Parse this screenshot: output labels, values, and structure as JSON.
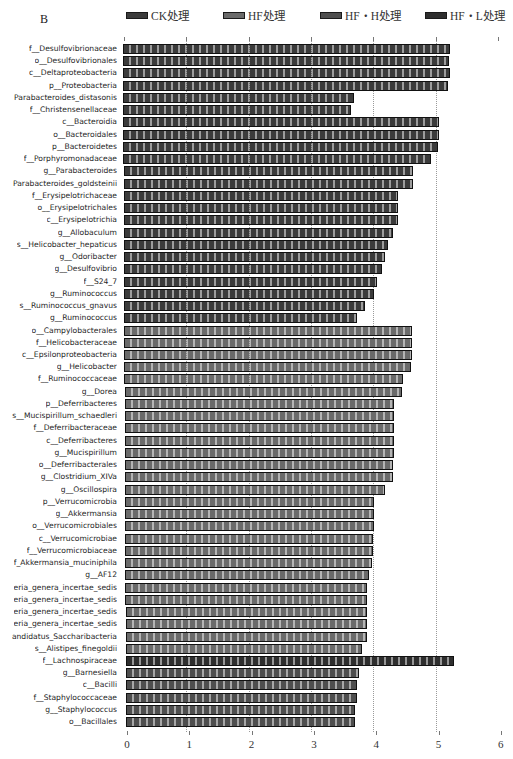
{
  "panel_label": "B",
  "legend": [
    {
      "label": "CK处理",
      "color": "#3b3b3b",
      "left": 126
    },
    {
      "label": "HF处理",
      "color": "#6a6a6a",
      "left": 223
    },
    {
      "label": "HF・H处理",
      "color": "#4e4e4e",
      "left": 320
    },
    {
      "label": "HF・L处理",
      "color": "#2e2e2e",
      "left": 425
    }
  ],
  "group_colors": {
    "CK": "#3b3b3b",
    "HF": "#6a6a6a",
    "HF_H": "#4e4e4e",
    "HF_L": "#2e2e2e"
  },
  "axis": {
    "ticks": [
      "0",
      "1",
      "2",
      "3",
      "4",
      "5",
      "6"
    ],
    "gridlines_at": [
      1,
      2,
      3,
      4,
      5
    ]
  },
  "chart_data": {
    "type": "bar",
    "orientation": "horizontal",
    "title": "",
    "xlabel": "",
    "ylabel": "",
    "xlim": [
      0,
      6
    ],
    "grid": "vertical dotted",
    "legend_position": "top",
    "legend": [
      "CK处理",
      "HF处理",
      "HF・H处理",
      "HF・L处理"
    ],
    "categories": [
      "f__Desulfovibrionaceae",
      "o__Desulfovibrionales",
      "c__Deltaproteobacteria",
      "p__Proteobacteria",
      "Parabacteroides_distasonis",
      "f__Christensenellaceae",
      "c__Bacteroidia",
      "o__Bacteroidales",
      "p__Bacteroidetes",
      "f__Porphyromonadaceae",
      "g__Parabacteroides",
      "Parabacteroides_goldsteinii",
      "f__Erysipelotrichaceae",
      "o__Erysipelotrichales",
      "c__Erysipelotrichia",
      "g__Allobaculum",
      "s__Helicobacter_hepaticus",
      "g__Odoribacter",
      "g__Desulfovibrio",
      "f__S24_7",
      "g__Ruminococcus",
      "s__Ruminococcus_gnavus",
      "g__Ruminococcus",
      "o__Campylobacterales",
      "f__Helicobacteraceae",
      "c__Epsilonproteobacteria",
      "g__Helicobacter",
      "f__Ruminococcaceae",
      "g__Dorea",
      "p__Deferribacteres",
      "s__Mucispirillum_schaedleri",
      "f__Deferribacteraceae",
      "c__Deferribacteres",
      "g__Mucispirillum",
      "o__Deferribacterales",
      "g__Clostridium_XIVa",
      "g__Oscillospira",
      "p__Verrucomicrobia",
      "g__Akkermansia",
      "o__Verrucomicrobiales",
      "c__Verrucomicrobiae",
      "f__Verrucomicrobiaceae",
      "f_Akkermansia_muciniphila",
      "g__AF12",
      "eria_genera_incertae_sedis",
      "eria_genera_incertae_sedis",
      "eria_genera_incertae_sedis",
      "eria_genera_incertae_sedis",
      "andidatus_Saccharibacteria",
      "s__Alistipes_finegoldii",
      "f__Lachnospiraceae",
      "g__Barnesiella",
      "c__Bacilli",
      "f__Staphylococcaceae",
      "g__Staphylococcus",
      "o__Bacillales"
    ],
    "values": [
      5.25,
      5.24,
      5.24,
      5.22,
      3.71,
      3.65,
      5.07,
      5.07,
      5.05,
      4.94,
      4.64,
      4.64,
      4.41,
      4.41,
      4.4,
      4.32,
      4.24,
      4.19,
      4.14,
      4.06,
      4.01,
      3.86,
      3.73,
      4.62,
      4.62,
      4.61,
      4.6,
      4.47,
      4.45,
      4.32,
      4.32,
      4.32,
      4.32,
      4.32,
      4.31,
      4.3,
      4.17,
      3.99,
      3.99,
      3.99,
      3.98,
      3.98,
      3.96,
      3.91,
      3.88,
      3.88,
      3.88,
      3.87,
      3.87,
      3.8,
      5.27,
      3.74,
      3.71,
      3.71,
      3.68,
      3.67
    ],
    "groups": [
      "CK",
      "CK",
      "CK",
      "CK",
      "CK",
      "CK",
      "CK",
      "CK",
      "CK",
      "CK",
      "CK",
      "CK",
      "CK",
      "CK",
      "CK",
      "CK",
      "CK",
      "CK",
      "CK",
      "CK",
      "CK",
      "CK",
      "CK",
      "HF",
      "HF",
      "HF",
      "HF",
      "HF",
      "HF",
      "HF",
      "HF",
      "HF",
      "HF",
      "HF",
      "HF",
      "HF",
      "HF",
      "HF",
      "HF",
      "HF",
      "HF",
      "HF",
      "HF",
      "HF",
      "HF",
      "HF",
      "HF",
      "HF",
      "HF",
      "HF",
      "HF_L",
      "HF_H",
      "HF_H",
      "HF_H",
      "HF_H",
      "HF_H"
    ]
  }
}
